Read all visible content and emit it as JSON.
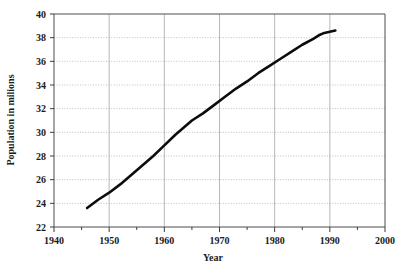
{
  "chart_data": {
    "type": "line",
    "title": "",
    "xlabel": "Year",
    "ylabel": "Population in milions",
    "xlim": [
      1940,
      2000
    ],
    "ylim": [
      22,
      40
    ],
    "xticks": [
      1940,
      1950,
      1960,
      1970,
      1980,
      1990,
      2000
    ],
    "xtick_labels": [
      "1940",
      "1950",
      "1960",
      "1970",
      "1980",
      "1990",
      "2000"
    ],
    "xminor_ticks": [
      1945,
      1955,
      1965,
      1975,
      1985,
      1995
    ],
    "yticks": [
      22,
      24,
      26,
      28,
      30,
      32,
      34,
      36,
      38,
      40
    ],
    "ytick_labels": [
      "22",
      "24",
      "26",
      "28",
      "30",
      "32",
      "34",
      "36",
      "38",
      "40"
    ],
    "grid": "horizontal-dotted-and-vertical-solid",
    "legend": "none",
    "series": [
      {
        "name": "Population",
        "color": "#0d0d0d",
        "x": [
          1946,
          1948,
          1950,
          1952,
          1954,
          1956,
          1958,
          1960,
          1962,
          1964,
          1965,
          1967,
          1969,
          1971,
          1973,
          1975,
          1977,
          1979,
          1981,
          1983,
          1985,
          1987,
          1988,
          1989,
          1990,
          1991
        ],
        "values": [
          23.6,
          24.3,
          24.9,
          25.6,
          26.4,
          27.2,
          28.0,
          28.9,
          29.8,
          30.6,
          31.0,
          31.6,
          32.3,
          33.0,
          33.7,
          34.3,
          35.0,
          35.6,
          36.2,
          36.8,
          37.4,
          37.9,
          38.2,
          38.4,
          38.5,
          38.6
        ]
      }
    ]
  },
  "labels": {
    "x_axis_title": "Year",
    "y_axis_title": "Population in milions"
  }
}
